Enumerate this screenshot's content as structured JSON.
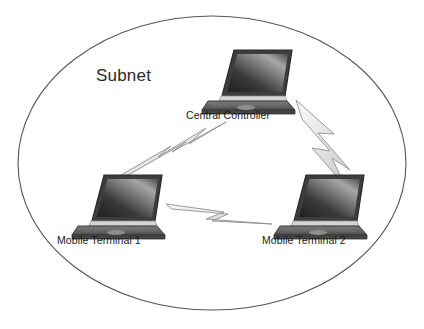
{
  "diagram": {
    "type": "network-topology",
    "background_color": "#ffffff",
    "zone": {
      "name": "subnet-boundary",
      "shape": "ellipse",
      "label": "Subnet",
      "stroke_color": "#555555",
      "fill": "none",
      "center": {
        "x": 212,
        "y": 163
      },
      "radius_x": 194,
      "radius_y": 147
    },
    "nodes": [
      {
        "id": "central-controller",
        "label": "Central Controller",
        "icon": "laptop-icon",
        "x": 248,
        "y": 78
      },
      {
        "id": "mobile-terminal-1",
        "label": "Mobile Terminal 1",
        "icon": "laptop-icon",
        "x": 118,
        "y": 203
      },
      {
        "id": "mobile-terminal-2",
        "label": "Mobile Terminal 2",
        "icon": "laptop-icon",
        "x": 320,
        "y": 203
      }
    ],
    "links": [
      {
        "id": "link-cc-mt1",
        "from": "central-controller",
        "to": "mobile-terminal-1",
        "style": "wireless-lightning"
      },
      {
        "id": "link-cc-mt2",
        "from": "central-controller",
        "to": "mobile-terminal-2",
        "style": "wireless-lightning"
      },
      {
        "id": "link-mt1-mt2",
        "from": "mobile-terminal-1",
        "to": "mobile-terminal-2",
        "style": "wireless-lightning"
      }
    ],
    "colors": {
      "laptop_screen_dark": "#2a2a2a",
      "laptop_screen_light": "#8f8f8f",
      "laptop_body": "#6e6e6e",
      "laptop_body_dark": "#4a4a4a",
      "laptop_hinge": "#d8d8d8",
      "bolt_fill": "#e8e8e8",
      "bolt_stroke": "#8a8a8a",
      "text": "#1a1a1a"
    }
  }
}
